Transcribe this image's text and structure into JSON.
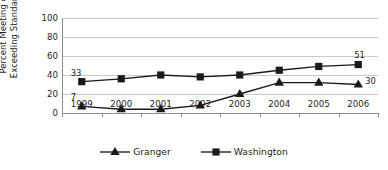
{
  "chart_data": {
    "type": "line",
    "title": "",
    "xlabel": "",
    "ylabel": "Percent Meeting or Exceeding Standards",
    "ylabel_line1": "Percent Meeting or",
    "ylabel_line2": "Exceeding Standards",
    "categories": [
      "1999",
      "2000",
      "2001",
      "2002",
      "2003",
      "2004",
      "2005",
      "2006"
    ],
    "ylim": [
      0,
      100
    ],
    "yticks": [
      100,
      80,
      60,
      40,
      20,
      0
    ],
    "grid": true,
    "legend_position": "bottom-center",
    "series": [
      {
        "name": "Granger",
        "marker": "triangle",
        "color": "#1a1a1a",
        "values": [
          7,
          4,
          4,
          8,
          20,
          32,
          32,
          30
        ],
        "point_labels": [
          {
            "index": 0,
            "text": "7",
            "position": "above-left"
          },
          {
            "index": 7,
            "text": "30",
            "position": "right"
          }
        ]
      },
      {
        "name": "Washington",
        "marker": "square",
        "color": "#1a1a1a",
        "values": [
          33,
          36,
          40,
          38,
          40,
          45,
          49,
          51
        ],
        "point_labels": [
          {
            "index": 0,
            "text": "33",
            "position": "above-left"
          },
          {
            "index": 7,
            "text": "51",
            "position": "above"
          }
        ]
      }
    ]
  },
  "legend": {
    "items": [
      {
        "label": "Granger",
        "marker": "triangle"
      },
      {
        "label": "Washington",
        "marker": "square"
      }
    ]
  },
  "annotations": {
    "granger_1999": "7",
    "granger_2006": "30",
    "washington_1999": "33",
    "washington_2006": "51"
  }
}
